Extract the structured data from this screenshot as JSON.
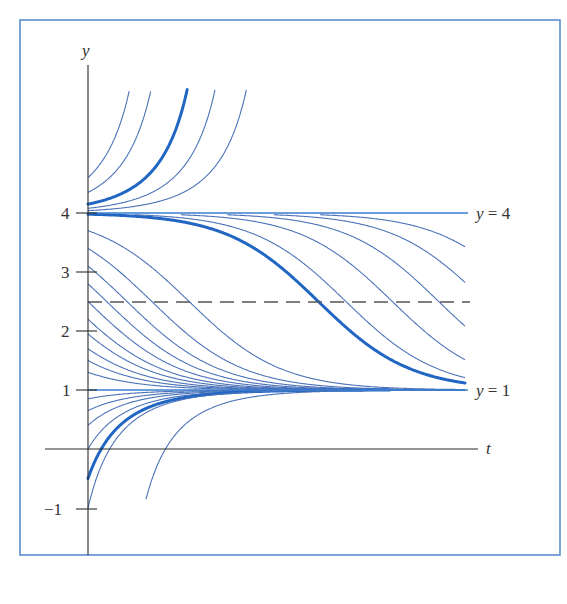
{
  "figure": {
    "frame_color": "#5b8fd0",
    "curve_color": "#4a72b8",
    "highlight_color": "#2266c4",
    "axis_color": "#2b2b2b"
  },
  "axes": {
    "x_label": "t",
    "y_label": "y",
    "y_ticks": [
      {
        "value": 4,
        "label": "4"
      },
      {
        "value": 3,
        "label": "3"
      },
      {
        "value": 2,
        "label": "2"
      },
      {
        "value": 1,
        "label": "1"
      },
      {
        "value": -1,
        "label": "−1"
      }
    ]
  },
  "annotations": {
    "upper_equilibrium": {
      "y": 4,
      "label_var": "y",
      "label_rest": " = 4"
    },
    "lower_equilibrium": {
      "y": 1,
      "label_var": "y",
      "label_rest": " = 1"
    },
    "inflection_line": {
      "y": 2.5,
      "style": "dashed"
    }
  },
  "chart_data": {
    "type": "line",
    "title": "",
    "xlabel": "t",
    "ylabel": "y",
    "ylim": [
      -1.7,
      6.5
    ],
    "equilibria": [
      {
        "y": 4,
        "stability": "unstable"
      },
      {
        "y": 1,
        "stability": "stable"
      }
    ],
    "inflection_y": 2.5,
    "series": [
      {
        "name": "above-4",
        "initial_values": [
          4.6,
          4.35,
          4.15,
          4.08,
          4.04
        ],
        "highlight_index": 2
      },
      {
        "name": "between-1-and-4",
        "initial_values": [
          3.98,
          3.7,
          3.4,
          3.1,
          2.8,
          2.5,
          2.2,
          1.95,
          1.7,
          1.5,
          1.3
        ],
        "highlight_index": 0
      },
      {
        "name": "below-1",
        "initial_values": [
          0.85,
          0.65,
          0.4,
          0.0,
          -0.5,
          -1.0,
          -0.85
        ],
        "highlight_index": 4
      }
    ]
  }
}
